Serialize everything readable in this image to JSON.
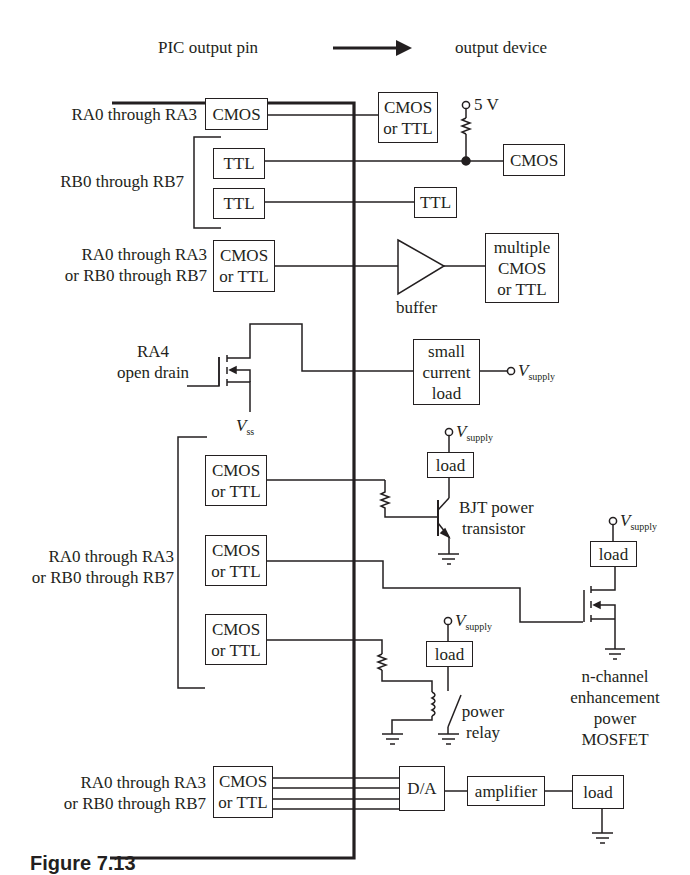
{
  "header": {
    "left_label": "PIC output pin",
    "right_label": "output device",
    "arrow_icon": "right-arrow"
  },
  "rows": [
    {
      "id": "cmos-pullup",
      "pin_label": "RA0 through RA3",
      "pin_driver": "CMOS",
      "outputs": [
        {
          "label_lines": [
            "CMOS",
            "or TTL"
          ]
        }
      ]
    },
    {
      "id": "ttl-rows",
      "pin_label": "RB0 through RB7",
      "drivers": [
        "TTL",
        "TTL"
      ],
      "pullup": {
        "voltage": "5 V"
      },
      "outputs": [
        {
          "label_lines": [
            "CMOS"
          ]
        },
        {
          "label_lines": [
            "TTL"
          ]
        }
      ]
    },
    {
      "id": "buffer",
      "pin_label_lines": [
        "RA0 through RA3",
        "or RB0 through RB7"
      ],
      "driver_lines": [
        "CMOS",
        "or TTL"
      ],
      "component_label": "buffer",
      "output_lines": [
        "multiple",
        "CMOS",
        "or TTL"
      ]
    },
    {
      "id": "open-drain",
      "pin_label_lines": [
        "RA4",
        "open drain"
      ],
      "source_label": "V",
      "source_sub": "ss",
      "load_lines": [
        "small",
        "current",
        "load"
      ],
      "supply": {
        "symbol": "V",
        "sub": "supply"
      }
    },
    {
      "id": "power-drivers",
      "pin_label_lines": [
        "RA0 through RA3",
        "or RB0 through RB7"
      ],
      "drivers": [
        {
          "lines": [
            "CMOS",
            "or TTL"
          ]
        },
        {
          "lines": [
            "CMOS",
            "or TTL"
          ]
        },
        {
          "lines": [
            "CMOS",
            "or TTL"
          ]
        }
      ],
      "bjt": {
        "supply": {
          "symbol": "V",
          "sub": "supply"
        },
        "load": "load",
        "label_lines": [
          "BJT power",
          "transistor"
        ]
      },
      "mosfet": {
        "supply": {
          "symbol": "V",
          "sub": "supply"
        },
        "load": "load",
        "label_lines": [
          "n-channel",
          "enhancement",
          "power",
          "MOSFET"
        ]
      },
      "relay": {
        "supply": {
          "symbol": "V",
          "sub": "supply"
        },
        "load": "load",
        "label_lines": [
          "power",
          "relay"
        ]
      }
    },
    {
      "id": "dac",
      "pin_label_lines": [
        "RA0 through RA3",
        "or RB0 through RB7"
      ],
      "driver_lines": [
        "CMOS",
        "or TTL"
      ],
      "dac_label": "D/A",
      "amp_label": "amplifier",
      "load_label": "load"
    }
  ],
  "caption": {
    "text": "Figure 7.13"
  },
  "colors": {
    "ink": "#231f20",
    "background": "#ffffff"
  }
}
